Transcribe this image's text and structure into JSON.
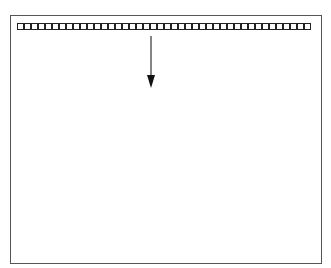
{
  "diagram": {
    "square_count": 42,
    "colors": {
      "stroke": "#222222",
      "frame": "#555555",
      "background": "#ffffff"
    },
    "arrow": {
      "direction": "down"
    }
  }
}
